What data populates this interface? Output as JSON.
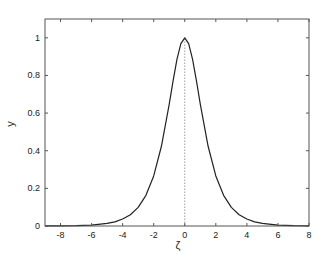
{
  "chart_data": {
    "type": "line",
    "title": "",
    "xlabel": "ζ",
    "ylabel": "y",
    "xlim": [
      -9,
      8
    ],
    "ylim": [
      0,
      1.1
    ],
    "xticks": [
      -8,
      -6,
      -4,
      -2,
      0,
      2,
      4,
      6,
      8
    ],
    "xtick_labels": [
      "-8",
      "-6",
      "-4",
      "-2",
      "0",
      "2",
      "4",
      "6",
      "8"
    ],
    "yticks": [
      0,
      0.2,
      0.4,
      0.6,
      0.8,
      1
    ],
    "ytick_labels": [
      "0",
      "0.2",
      "0.4",
      "0.6",
      "0.8",
      "1"
    ],
    "grid": false,
    "legend": null,
    "reference_line": {
      "type": "vertical",
      "x": 0,
      "style": "dotted"
    },
    "series": [
      {
        "name": "y(ζ)",
        "x": [
          -9,
          -8,
          -7,
          -6,
          -5,
          -4.5,
          -4,
          -3.5,
          -3,
          -2.5,
          -2,
          -1.5,
          -1,
          -0.75,
          -0.5,
          -0.25,
          0,
          0.25,
          0.5,
          0.75,
          1,
          1.5,
          2,
          2.5,
          3,
          3.5,
          4,
          4.5,
          5,
          6,
          7,
          8
        ],
        "y": [
          0.0002,
          0.0007,
          0.0018,
          0.005,
          0.0135,
          0.022,
          0.037,
          0.06,
          0.099,
          0.163,
          0.266,
          0.425,
          0.648,
          0.772,
          0.887,
          0.969,
          1.0,
          0.969,
          0.887,
          0.772,
          0.648,
          0.425,
          0.266,
          0.163,
          0.099,
          0.06,
          0.037,
          0.022,
          0.0135,
          0.005,
          0.0018,
          0.0007
        ]
      }
    ]
  }
}
